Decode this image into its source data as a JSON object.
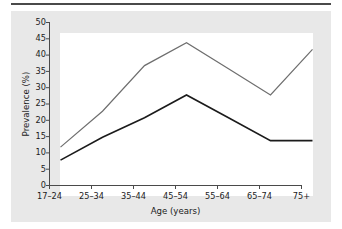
{
  "chart_data": {
    "type": "line",
    "title": "",
    "xlabel": "Age (years)",
    "ylabel": "Prevalence (%)",
    "categories": [
      "17–24",
      "25–34",
      "35–44",
      "45–54",
      "55–64",
      "65–74",
      "75+"
    ],
    "ylim": [
      0,
      50
    ],
    "yticks": [
      0,
      5,
      10,
      15,
      20,
      25,
      30,
      35,
      40,
      45,
      50
    ],
    "ytick_labels": [
      "0",
      "5",
      "10",
      "15",
      "20",
      "25",
      "30",
      "35",
      "40",
      "45",
      "50"
    ],
    "grid": false,
    "legend": "none",
    "series": [
      {
        "name": "upper-line",
        "color": "#6e6e6e",
        "values": [
          15,
          26,
          40,
          47,
          39,
          31,
          45
        ]
      },
      {
        "name": "lower-line",
        "color": "#1b1b1b",
        "values": [
          11,
          18,
          24,
          31,
          24,
          17,
          17
        ]
      }
    ]
  },
  "style": {
    "page_background": "#ffffff",
    "panel_background": "#e8e8e8",
    "plot_background": "#ffffff",
    "axis_color": "#4a4a4a",
    "rule_color": "#4a4a4a",
    "text_color": "#1b1b1b"
  }
}
